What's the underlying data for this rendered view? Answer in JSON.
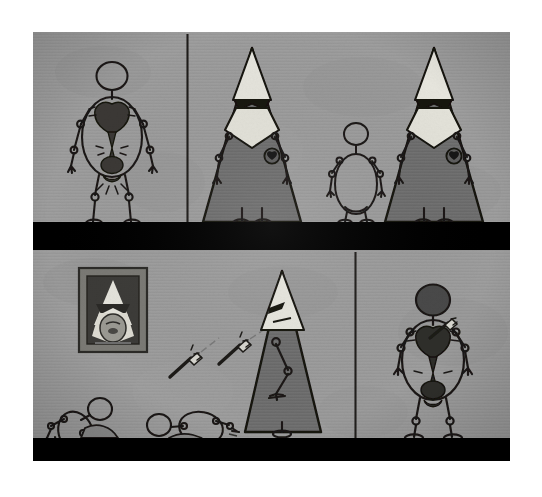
{
  "artwork": {
    "title": "Stick-figure comic strip with hooded conical figures",
    "medium": "ink and gouache on textured grey paper",
    "canvas": {
      "width": 542,
      "height": 497,
      "border_color": "#ffffff"
    },
    "art_area": {
      "x": 33,
      "y": 32,
      "width": 477,
      "height": 429
    },
    "palette": {
      "paper_grey": "#9a9a9a",
      "paper_grey_light": "#a3a3a3",
      "paper_grey_dark": "#8d8d8d",
      "robe_grey": "#6e6e6e",
      "robe_grey_dark": "#666666",
      "hood_white": "#e8e7e0",
      "hood_white_dim": "#dcdbd3",
      "ink_black": "#14120f",
      "ground_black": "#000000",
      "frame_grey": "#7b7a75",
      "frame_inner_dark": "#3c3b38",
      "organ_dark": "#3a3936",
      "blade_light": "#d8d7d0"
    },
    "rows": [
      {
        "name": "top-row",
        "y": 0,
        "height": 192,
        "ground_band": {
          "y": 190,
          "height": 26,
          "color": "#000000"
        },
        "panels": [
          {
            "name": "panel-1",
            "x": 0,
            "width": 154,
            "divider_right": true,
            "caption": "Nude stick figure standing, heart and entrails exposed",
            "figures": [
              "bare-figure-exposed-organs"
            ]
          },
          {
            "name": "panel-2",
            "x": 156,
            "width": 321,
            "divider_right": false,
            "caption": "Two tall hooded robed figures flanking a small bare stick figure",
            "figures": [
              "hooded-figure-left",
              "small-bare-figure",
              "hooded-figure-right"
            ]
          }
        ]
      },
      {
        "name": "bottom-row",
        "y": 218,
        "height": 211,
        "ground_band": {
          "y": 406,
          "height": 23,
          "color": "#000000"
        },
        "panels": [
          {
            "name": "panel-3",
            "x": 0,
            "width": 322,
            "divider_right": true,
            "caption": "Framed portrait of a hooded figure above two fallen stick figures, with flying darts",
            "figures": [
              "framed-portrait",
              "dart-1",
              "dart-2",
              "fallen-figure-left",
              "fallen-figure-right",
              "hooded-figure-thrower"
            ]
          },
          {
            "name": "panel-4",
            "x": 324,
            "width": 153,
            "divider_right": false,
            "caption": "Bare stick figure struck in the heart by a dart",
            "figures": [
              "struck-figure"
            ]
          }
        ]
      }
    ],
    "elements": {
      "bare_figure_label": "bare stick figure",
      "hooded_figure_label": "hooded conical figure",
      "badge_label": "hood badge emblem",
      "portrait_label": "framed hood portrait",
      "dart_label": "flying dart",
      "heart_label": "exposed heart",
      "ground_label": "black ground band",
      "divider_label": "panel divider line"
    }
  }
}
